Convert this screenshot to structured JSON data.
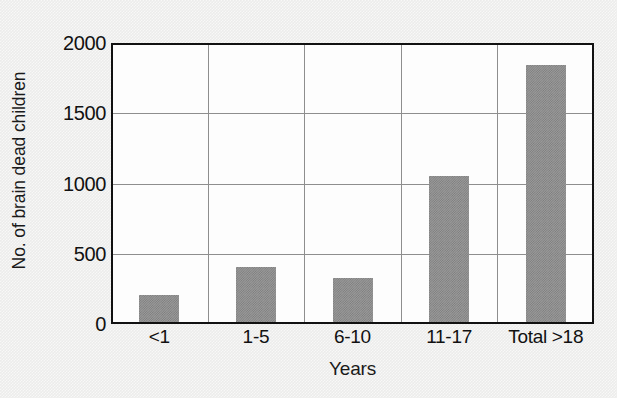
{
  "chart_data": {
    "type": "bar",
    "title": "",
    "xlabel": "Years",
    "ylabel": "No. of brain dead children",
    "categories": [
      "<1",
      "1-5",
      "6-10",
      "11-17",
      "Total >18"
    ],
    "values": [
      190,
      390,
      310,
      1040,
      1830
    ],
    "series": [
      {
        "name": "No. of brain dead children",
        "values": [
          190,
          390,
          310,
          1040,
          1830
        ]
      }
    ],
    "ylim": [
      0,
      2000
    ],
    "y_ticks": [
      0,
      500,
      1000,
      1500,
      2000
    ],
    "y_tick_labels": [
      "0",
      "500",
      "1000",
      "1500",
      "2000"
    ],
    "grid": "horizontal-and-vertical",
    "legend": "none",
    "bar_color": "#9a9a9a",
    "axis_color": "#111111",
    "gridline_color": "#8e8e8e",
    "plot_background": "#fdfdfd",
    "figure_background": "#ececeb"
  }
}
